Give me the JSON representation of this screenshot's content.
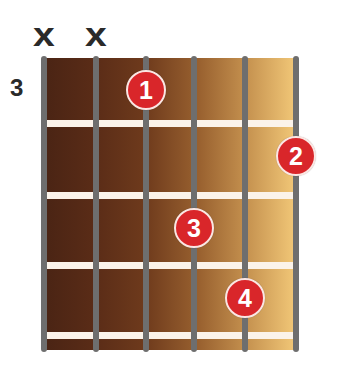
{
  "chord": {
    "start_fret_label": "3",
    "strings": 6,
    "frets_shown": 4,
    "muted_strings": [
      {
        "string": 6,
        "symbol": "x"
      },
      {
        "string": 5,
        "symbol": "x"
      }
    ],
    "fingers": [
      {
        "finger": "1",
        "string": 4,
        "fret": 1
      },
      {
        "finger": "2",
        "string": 1,
        "fret": 2
      },
      {
        "finger": "3",
        "string": 3,
        "fret": 3
      },
      {
        "finger": "4",
        "string": 2,
        "fret": 4
      }
    ]
  },
  "colors": {
    "dot": "#d9262a",
    "string": "#6e6e6e",
    "fret": "#fbf3ea",
    "board_dark": "#4a2414",
    "board_light": "#f2c878"
  }
}
